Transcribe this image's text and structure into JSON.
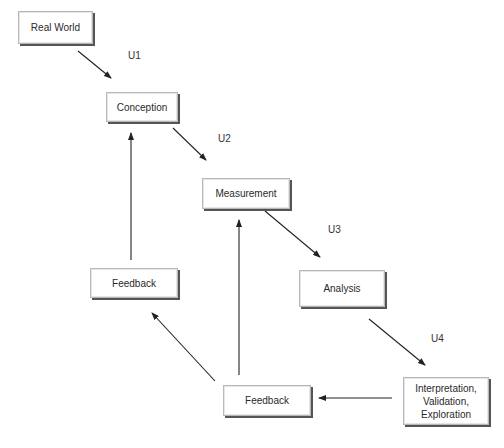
{
  "diagram": {
    "nodes": [
      {
        "id": "real-world",
        "label": "Real World"
      },
      {
        "id": "conception",
        "label": "Conception"
      },
      {
        "id": "measurement",
        "label": "Measurement"
      },
      {
        "id": "analysis",
        "label": "Analysis"
      },
      {
        "id": "feedback-left",
        "label": "Feedback"
      },
      {
        "id": "feedback-bottom",
        "label": "Feedback"
      },
      {
        "id": "interpretation",
        "label": "Interpretation,\nValidation,\nExploration"
      }
    ],
    "edge_labels": [
      {
        "id": "u1",
        "label": "U1"
      },
      {
        "id": "u2",
        "label": "U2"
      },
      {
        "id": "u3",
        "label": "U3"
      },
      {
        "id": "u4",
        "label": "U4"
      }
    ],
    "edges": [
      {
        "from": "real-world",
        "to": "conception",
        "label": "U1"
      },
      {
        "from": "conception",
        "to": "measurement",
        "label": "U2"
      },
      {
        "from": "measurement",
        "to": "analysis",
        "label": "U3"
      },
      {
        "from": "analysis",
        "to": "interpretation",
        "label": "U4"
      },
      {
        "from": "interpretation",
        "to": "feedback-bottom",
        "label": ""
      },
      {
        "from": "feedback-bottom",
        "to": "feedback-left",
        "label": ""
      },
      {
        "from": "feedback-bottom",
        "to": "measurement",
        "label": ""
      },
      {
        "from": "feedback-left",
        "to": "conception",
        "label": ""
      }
    ],
    "colors": {
      "box_border": "#b8b8b8",
      "box_shadow": "#555555",
      "arrow": "#222222",
      "text": "#2a2a2a"
    }
  }
}
